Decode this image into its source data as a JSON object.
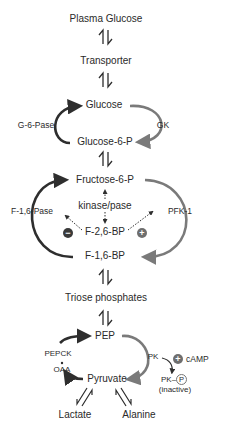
{
  "nodes": {
    "plasma_glucose": "Plasma   Glucose",
    "transporter": "Transporter",
    "glucose": "Glucose",
    "glucose_6_p": "Glucose-6-P",
    "fructose_6_p": "Fructose-6-P",
    "kinase_pase": "kinase/pase",
    "f_2_6_bp": "F-2,6-BP",
    "f_1_6_bp": "F-1,6-BP",
    "triose_phosphates": "Triose phosphates",
    "pep": "PEP",
    "pyruvate": "Pyruvate",
    "lactate": "Lactate",
    "alanine": "Alanine",
    "oaa": "OAA",
    "pk_p": "PK–",
    "pk_p_symbol": "P",
    "inactive": "(inactive)",
    "camp": "cAMP"
  },
  "enzymes": {
    "g6pase": "G-6-Pase",
    "gk": "GK",
    "f16pase": "F-1,6-Pase",
    "pfk1": "PFK-1",
    "pepck": "PEPCK",
    "pk": "PK"
  },
  "regulators": {
    "inhibit": "−",
    "activate": "+",
    "camp_effect": "+"
  },
  "colors": {
    "dark_arrow": "#2e2e2e",
    "grey_arrow": "#7a7a7a",
    "text": "#2a2a2a"
  }
}
